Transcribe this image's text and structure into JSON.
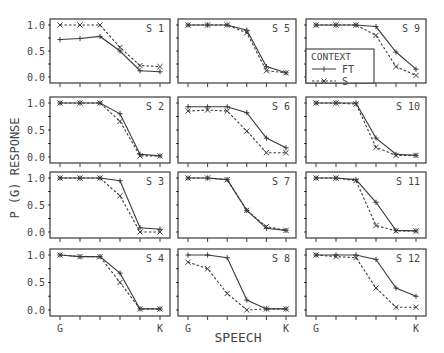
{
  "figure": {
    "ylabel": "P (G)  RESPONSE",
    "xlabel": "SPEECH",
    "x_start_label": "G",
    "x_end_label": "K",
    "yticks": [
      "0.0",
      "0.5",
      "1.0"
    ],
    "legend": {
      "title": "CONTEXT",
      "entries": [
        {
          "label": "FT",
          "style": "solid",
          "marker": "+"
        },
        {
          "label": "S",
          "style": "dashed",
          "marker": "x"
        }
      ]
    }
  },
  "chart_data": {
    "type": "line",
    "title": "",
    "xlabel": "SPEECH",
    "ylabel": "P (G) RESPONSE",
    "ylim": [
      0,
      1
    ],
    "x": [
      1,
      2,
      3,
      4,
      5,
      6
    ],
    "x_tick_labels": [
      "G",
      "",
      "",
      "",
      "",
      "K"
    ],
    "grid": false,
    "legend_position": "inside panel S 9, lower left",
    "panels": [
      {
        "name": "S 1",
        "series": [
          {
            "name": "FT",
            "values": [
              0.72,
              0.74,
              0.78,
              0.5,
              0.12,
              0.1
            ]
          },
          {
            "name": "S",
            "values": [
              1.0,
              1.0,
              1.0,
              0.57,
              0.22,
              0.2
            ]
          }
        ],
        "s_line": [
          0.88,
          0.88,
          0.92,
          0.62,
          0.22,
          0.2
        ]
      },
      {
        "name": "S 5",
        "series": [
          {
            "name": "FT",
            "values": [
              1.0,
              1.0,
              1.0,
              0.9,
              0.2,
              0.08
            ]
          },
          {
            "name": "S",
            "values": [
              1.0,
              1.0,
              1.0,
              0.85,
              0.12,
              0.08
            ]
          }
        ]
      },
      {
        "name": "S 9",
        "series": [
          {
            "name": "FT",
            "values": [
              1.0,
              1.0,
              1.0,
              0.97,
              0.48,
              0.15
            ]
          },
          {
            "name": "S",
            "values": [
              1.0,
              1.0,
              1.0,
              0.8,
              0.2,
              0.03
            ]
          }
        ]
      },
      {
        "name": "S 2",
        "series": [
          {
            "name": "FT",
            "values": [
              1.0,
              1.0,
              1.0,
              0.8,
              0.05,
              0.02
            ]
          },
          {
            "name": "S",
            "values": [
              1.0,
              1.0,
              1.0,
              0.66,
              0.02,
              0.02
            ]
          }
        ]
      },
      {
        "name": "S 6",
        "series": [
          {
            "name": "FT",
            "values": [
              0.93,
              0.93,
              0.93,
              0.82,
              0.35,
              0.17
            ]
          },
          {
            "name": "S",
            "values": [
              0.85,
              0.87,
              0.85,
              0.48,
              0.08,
              0.08
            ]
          }
        ]
      },
      {
        "name": "S 10",
        "series": [
          {
            "name": "FT",
            "values": [
              1.0,
              1.0,
              1.0,
              0.35,
              0.05,
              0.03
            ]
          },
          {
            "name": "S",
            "values": [
              1.0,
              1.0,
              0.98,
              0.18,
              0.03,
              0.03
            ]
          }
        ]
      },
      {
        "name": "S 3",
        "series": [
          {
            "name": "FT",
            "values": [
              1.0,
              1.0,
              1.0,
              0.95,
              0.08,
              0.05
            ]
          },
          {
            "name": "S",
            "values": [
              1.0,
              1.0,
              1.0,
              0.67,
              0.0,
              0.0
            ]
          }
        ]
      },
      {
        "name": "S 7",
        "series": [
          {
            "name": "FT",
            "values": [
              1.0,
              1.0,
              0.97,
              0.4,
              0.07,
              0.03
            ]
          },
          {
            "name": "S",
            "values": [
              1.0,
              1.0,
              0.97,
              0.4,
              0.1,
              0.03
            ]
          }
        ]
      },
      {
        "name": "S 11",
        "series": [
          {
            "name": "FT",
            "values": [
              1.0,
              1.0,
              0.97,
              0.55,
              0.03,
              0.02
            ]
          },
          {
            "name": "S",
            "values": [
              1.0,
              1.0,
              0.95,
              0.12,
              0.02,
              0.02
            ]
          }
        ]
      },
      {
        "name": "S 4",
        "series": [
          {
            "name": "FT",
            "values": [
              1.0,
              0.97,
              0.97,
              0.67,
              0.02,
              0.02
            ]
          },
          {
            "name": "S",
            "values": [
              1.0,
              0.97,
              0.97,
              0.5,
              0.02,
              0.02
            ]
          }
        ]
      },
      {
        "name": "S 8",
        "series": [
          {
            "name": "FT",
            "values": [
              1.0,
              1.0,
              0.95,
              0.18,
              0.02,
              0.02
            ]
          },
          {
            "name": "S",
            "values": [
              0.87,
              0.75,
              0.3,
              0.0,
              0.02,
              0.02
            ]
          }
        ]
      },
      {
        "name": "S 12",
        "series": [
          {
            "name": "FT",
            "values": [
              1.0,
              1.0,
              1.0,
              0.92,
              0.4,
              0.25
            ]
          },
          {
            "name": "S",
            "values": [
              1.0,
              0.97,
              0.95,
              0.4,
              0.05,
              0.05
            ]
          }
        ]
      }
    ]
  }
}
